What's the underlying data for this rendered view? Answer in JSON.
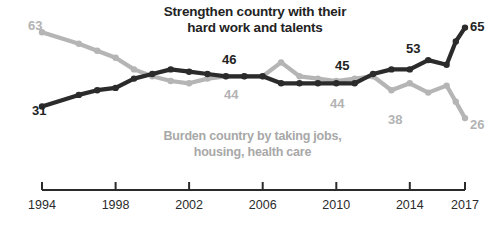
{
  "chart_data": {
    "type": "line",
    "title": "Strengthen country with their hard work and talents",
    "subtitle": "Burden country by taking jobs, housing, health care",
    "xlabel": "",
    "ylabel": "",
    "xlim": [
      1994,
      2017
    ],
    "ylim": [
      20,
      70
    ],
    "grid": false,
    "legend_position": "inline-labels",
    "tick_labels": [
      "1994",
      "1998",
      "2002",
      "2006",
      "2010",
      "2014",
      "2017"
    ],
    "tick_years": [
      1994,
      1998,
      2002,
      2006,
      2010,
      2014,
      2017
    ],
    "colors": {
      "strengthen": "#2b2b2b",
      "burden": "#b5b5b5",
      "axis": "#2b2b2b",
      "background": "#ffffff"
    },
    "series": [
      {
        "name": "Strengthen country with their hard work and talents",
        "color": "#2b2b2b",
        "x": [
          1994,
          1996,
          1997,
          1998,
          1999,
          2000,
          2001,
          2002,
          2003,
          2004,
          2005,
          2006,
          2007,
          2008,
          2009,
          2010,
          2011,
          2012,
          2013,
          2014,
          2015,
          2016,
          2016.5,
          2017
        ],
        "values": [
          31,
          36,
          38,
          39,
          43,
          45,
          47,
          46,
          45,
          44,
          44,
          44,
          41,
          41,
          41,
          41,
          41,
          45,
          47,
          47,
          51,
          49,
          59,
          65
        ],
        "labeled_points": [
          {
            "year": 1994,
            "value": 31,
            "label": "31"
          },
          {
            "year": 2002,
            "value": 46,
            "label": "46"
          },
          {
            "year": 2012,
            "value": 45,
            "label": "45"
          },
          {
            "year": 2015,
            "value": 53,
            "label": "53"
          },
          {
            "year": 2017,
            "value": 65,
            "label": "65"
          }
        ]
      },
      {
        "name": "Burden country by taking jobs, housing, health care",
        "color": "#b5b5b5",
        "x": [
          1994,
          1996,
          1997,
          1998,
          1999,
          2000,
          2001,
          2002,
          2003,
          2004,
          2005,
          2006,
          2007,
          2008,
          2009,
          2010,
          2011,
          2012,
          2013,
          2014,
          2015,
          2016,
          2016.5,
          2017
        ],
        "values": [
          63,
          58,
          55,
          52,
          47,
          44,
          42,
          41,
          43,
          44,
          44,
          44,
          50,
          44,
          43,
          42,
          43,
          44,
          38,
          41,
          37,
          40,
          33,
          26
        ],
        "labeled_points": [
          {
            "year": 1994,
            "value": 63,
            "label": "63"
          },
          {
            "year": 2004,
            "value": 44,
            "label": "44"
          },
          {
            "year": 2012,
            "value": 44,
            "label": "44"
          },
          {
            "year": 2014,
            "value": 38,
            "label": "38"
          },
          {
            "year": 2017,
            "value": 26,
            "label": "26"
          }
        ]
      }
    ]
  },
  "annotations": {
    "title_line1": "Strengthen country with their",
    "title_line2": "hard work and talents",
    "subtitle_line1": "Burden country by taking jobs,",
    "subtitle_line2": "housing, health care",
    "v_31": "31",
    "v_63": "63",
    "v_46": "46",
    "v_44_upper": "44",
    "v_45": "45",
    "v_44_lower": "44",
    "v_53": "53",
    "v_38": "38",
    "v_65": "65",
    "v_26": "26"
  },
  "axis": {
    "t1994": "1994",
    "t1998": "1998",
    "t2002": "2002",
    "t2006": "2006",
    "t2010": "2010",
    "t2014": "2014",
    "t2017": "2017"
  }
}
